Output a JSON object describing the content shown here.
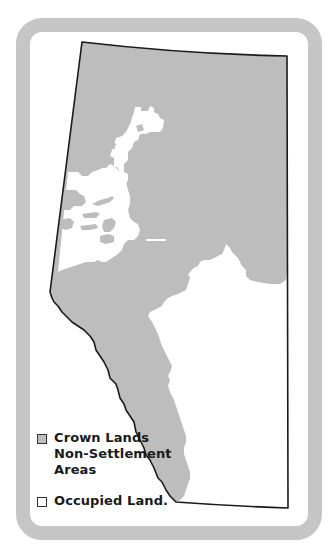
{
  "map": {
    "title": "Crown Lands vs Occupied Land",
    "colors": {
      "crown_land_fill": "#bdbdbd",
      "occupied_fill": "#ffffff",
      "border_stroke": "#1a1a1a",
      "frame": "#c6c6c6"
    }
  },
  "legend": {
    "items": [
      {
        "swatch_color": "#bdbdbd",
        "lines": [
          "Crown Lands",
          "Non-Settlement",
          "Areas"
        ]
      },
      {
        "swatch_color": "#ffffff",
        "lines": [
          "Occupied Land."
        ]
      }
    ]
  }
}
